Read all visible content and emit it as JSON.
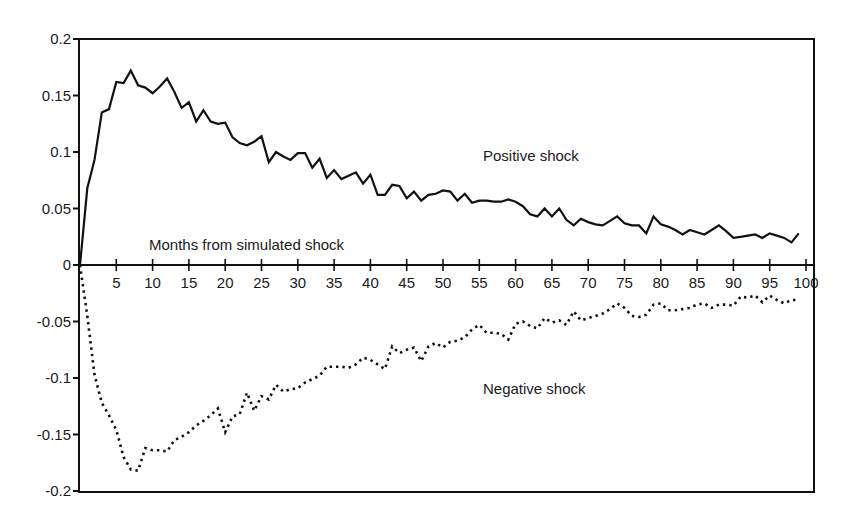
{
  "chart_data": {
    "type": "line",
    "title": "",
    "xlabel": "Months from simulated shock",
    "ylabel": "",
    "xlim": [
      0,
      100
    ],
    "ylim": [
      -0.2,
      0.2
    ],
    "grid": false,
    "legend": null,
    "x_ticks": [
      5,
      10,
      15,
      20,
      25,
      30,
      35,
      40,
      45,
      50,
      55,
      60,
      65,
      70,
      75,
      80,
      85,
      90,
      95,
      100
    ],
    "y_ticks": [
      0.2,
      0.15,
      0.1,
      0.05,
      0,
      -0.05,
      -0.1,
      -0.15,
      -0.2
    ],
    "y_tick_labels": [
      "0.2",
      "0.15",
      "0.1",
      "0.05",
      "0",
      "-0.05",
      "-0.1",
      "-0.15",
      "-0.2"
    ],
    "annotations": [
      {
        "text": "Positive shock",
        "x": 56,
        "y": 0.095
      },
      {
        "text": "Negative shock",
        "x": 56,
        "y": -0.108
      },
      {
        "text": "Months from simulated shock",
        "x": 9.5,
        "y": 0.018
      }
    ],
    "x": [
      0,
      1,
      2,
      3,
      4,
      5,
      6,
      7,
      8,
      9,
      10,
      11,
      12,
      13,
      14,
      15,
      16,
      17,
      18,
      19,
      20,
      21,
      22,
      23,
      24,
      25,
      26,
      27,
      28,
      29,
      30,
      31,
      32,
      33,
      34,
      35,
      36,
      37,
      38,
      39,
      40,
      41,
      42,
      43,
      44,
      45,
      46,
      47,
      48,
      49,
      50,
      51,
      52,
      53,
      54,
      55,
      56,
      57,
      58,
      59,
      60,
      61,
      62,
      63,
      64,
      65,
      66,
      67,
      68,
      69,
      70,
      71,
      72,
      73,
      74,
      75,
      76,
      77,
      78,
      79,
      80,
      81,
      82,
      83,
      84,
      85,
      86,
      87,
      88,
      89,
      90,
      91,
      92,
      93,
      94,
      95,
      96,
      97,
      98,
      99
    ],
    "series": [
      {
        "name": "Positive shock",
        "style": "solid",
        "color": "#111111",
        "values": [
          0,
          0.068,
          0.093,
          0.135,
          0.138,
          0.162,
          0.161,
          0.172,
          0.159,
          0.157,
          0.152,
          0.158,
          0.165,
          0.153,
          0.139,
          0.144,
          0.127,
          0.137,
          0.127,
          0.125,
          0.126,
          0.113,
          0.108,
          0.106,
          0.109,
          0.114,
          0.091,
          0.1,
          0.096,
          0.093,
          0.099,
          0.099,
          0.086,
          0.094,
          0.077,
          0.084,
          0.076,
          0.079,
          0.082,
          0.072,
          0.08,
          0.062,
          0.062,
          0.071,
          0.07,
          0.059,
          0.065,
          0.057,
          0.062,
          0.063,
          0.066,
          0.065,
          0.057,
          0.063,
          0.055,
          0.057,
          0.057,
          0.056,
          0.056,
          0.058,
          0.056,
          0.052,
          0.045,
          0.043,
          0.05,
          0.043,
          0.05,
          0.04,
          0.035,
          0.041,
          0.038,
          0.036,
          0.035,
          0.039,
          0.043,
          0.037,
          0.035,
          0.035,
          0.028,
          0.043,
          0.036,
          0.034,
          0.031,
          0.027,
          0.031,
          0.029,
          0.027,
          0.031,
          0.035,
          0.03,
          0.024,
          0.025,
          0.026,
          0.027,
          0.024,
          0.028,
          0.026,
          0.024,
          0.02,
          0.028
        ]
      },
      {
        "name": "Negative shock",
        "style": "dotted",
        "color": "#111111",
        "values": [
          0,
          -0.045,
          -0.097,
          -0.122,
          -0.133,
          -0.146,
          -0.17,
          -0.181,
          -0.182,
          -0.162,
          -0.164,
          -0.164,
          -0.165,
          -0.155,
          -0.152,
          -0.148,
          -0.142,
          -0.138,
          -0.133,
          -0.127,
          -0.148,
          -0.134,
          -0.132,
          -0.113,
          -0.129,
          -0.116,
          -0.119,
          -0.106,
          -0.112,
          -0.11,
          -0.109,
          -0.104,
          -0.101,
          -0.098,
          -0.09,
          -0.09,
          -0.09,
          -0.091,
          -0.088,
          -0.082,
          -0.084,
          -0.088,
          -0.092,
          -0.072,
          -0.078,
          -0.075,
          -0.073,
          -0.085,
          -0.072,
          -0.069,
          -0.073,
          -0.068,
          -0.067,
          -0.064,
          -0.057,
          -0.053,
          -0.06,
          -0.06,
          -0.061,
          -0.066,
          -0.052,
          -0.05,
          -0.054,
          -0.056,
          -0.047,
          -0.051,
          -0.049,
          -0.053,
          -0.041,
          -0.049,
          -0.047,
          -0.045,
          -0.043,
          -0.039,
          -0.034,
          -0.038,
          -0.045,
          -0.046,
          -0.044,
          -0.035,
          -0.034,
          -0.04,
          -0.04,
          -0.039,
          -0.038,
          -0.035,
          -0.034,
          -0.038,
          -0.035,
          -0.035,
          -0.036,
          -0.028,
          -0.029,
          -0.027,
          -0.033,
          -0.027,
          -0.031,
          -0.034,
          -0.031,
          -0.031
        ]
      }
    ]
  },
  "labels": {
    "positive": "Positive shock",
    "negative": "Negative shock",
    "xaxis": "Months from simulated shock"
  }
}
